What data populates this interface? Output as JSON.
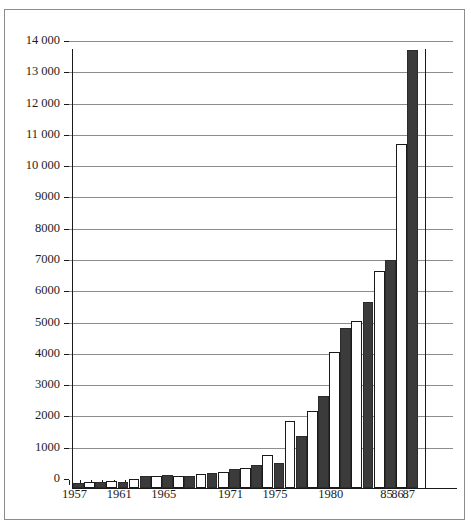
{
  "chart_data": {
    "type": "bar",
    "title": "",
    "xlabel": "",
    "ylabel": "",
    "ylim": [
      0,
      14000
    ],
    "grid": true,
    "legend": "none",
    "y_ticks": [
      0,
      1000,
      2000,
      3000,
      4000,
      5000,
      6000,
      7000,
      8000,
      9000,
      10000,
      11000,
      12000,
      13000,
      14000
    ],
    "y_tick_labels": [
      "0",
      "1000",
      "2000",
      "3000",
      "4000",
      "5000",
      "6000",
      "7000",
      "8000",
      "9000",
      "10 000",
      "11 000",
      "12 000",
      "13 000",
      "14 000"
    ],
    "x_tick_labels": [
      "1957",
      "1961",
      "1965",
      "1971",
      "1975",
      "1980",
      "85",
      "86",
      "87"
    ],
    "x_tick_label_categories": [
      "1957",
      "1961",
      "1965",
      "1971",
      "1975",
      "1980",
      "1985",
      "1986",
      "1987"
    ],
    "categories": [
      "1957",
      "1958",
      "1959",
      "1960",
      "1961",
      "1962",
      "1963",
      "1964",
      "1965",
      "1966",
      "1967",
      "1968",
      "1969",
      "1970",
      "1971",
      "1972",
      "1973",
      "1974",
      "1975",
      "1976",
      "1977",
      "1978",
      "1979",
      "1980",
      "1981",
      "1982",
      "1983",
      "1984",
      "1985",
      "1986",
      "1987"
    ],
    "values": [
      150,
      180,
      190,
      210,
      200,
      300,
      380,
      400,
      420,
      400,
      390,
      450,
      480,
      520,
      600,
      650,
      750,
      1050,
      800,
      2150,
      1650,
      2450,
      2950,
      4350,
      5100,
      5350,
      5950,
      6950,
      7300,
      11000,
      14000
    ],
    "bar_fills": [
      "dark",
      "light",
      "dark",
      "light",
      "dark",
      "light",
      "dark",
      "light",
      "dark",
      "light",
      "dark",
      "light",
      "dark",
      "light",
      "dark",
      "light",
      "dark",
      "light",
      "dark",
      "light",
      "dark",
      "light",
      "dark",
      "light",
      "dark",
      "light",
      "dark",
      "light",
      "dark",
      "light",
      "dark"
    ],
    "colors": {
      "dark_bar": "#3b3b3b",
      "light_bar": "#ffffff",
      "gridline": "#8d8d8d",
      "axis": "#1a1a1a",
      "frame": "#8c8c8c",
      "text": "#1d1d1d"
    }
  }
}
